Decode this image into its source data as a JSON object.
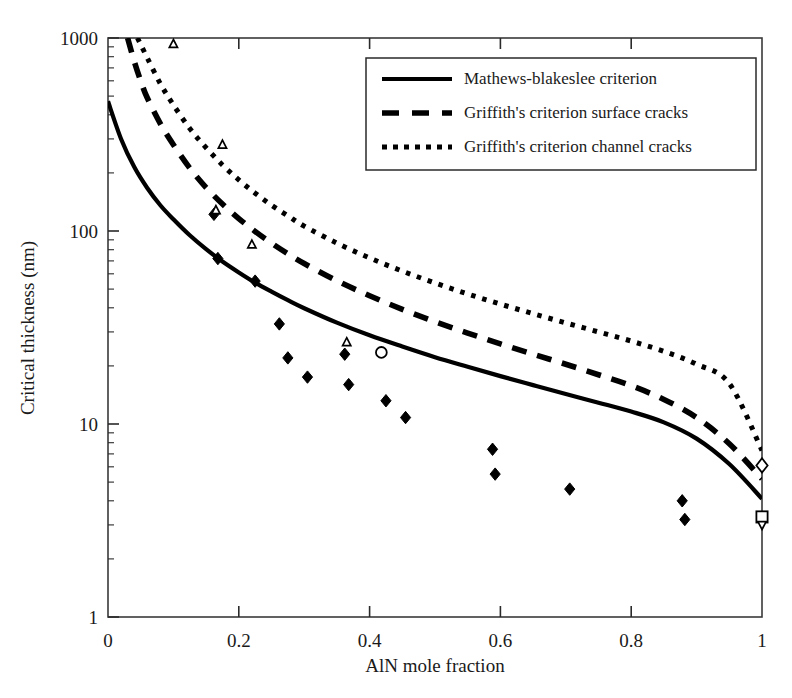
{
  "chart_data": {
    "type": "line",
    "title": "",
    "xlabel": "AlN mole fraction",
    "ylabel": "Critical thickness (nm)",
    "xlim": [
      0,
      1
    ],
    "ylim": [
      1,
      1000
    ],
    "yscale": "log",
    "xscale": "linear",
    "grid": false,
    "xticks": [
      "0",
      "0.2",
      "0.4",
      "0.6",
      "0.8",
      "1"
    ],
    "xtick_values": [
      0,
      0.2,
      0.4,
      0.6,
      0.8,
      1
    ],
    "yticks": [
      "1",
      "10",
      "100",
      "1000"
    ],
    "ytick_values": [
      1,
      10,
      100,
      1000
    ],
    "legend_position": "top-right",
    "series": [
      {
        "name": "Mathews-blakeslee criterion",
        "style": "solid",
        "color": "#000000",
        "x": [
          0.0,
          0.02,
          0.04,
          0.06,
          0.08,
          0.1,
          0.125,
          0.15,
          0.175,
          0.2,
          0.225,
          0.25,
          0.275,
          0.3,
          0.35,
          0.4,
          0.45,
          0.5,
          0.55,
          0.6,
          0.65,
          0.7,
          0.75,
          0.8,
          0.85,
          0.9,
          0.95,
          1.0
        ],
        "y": [
          470,
          300,
          215,
          167,
          136,
          115,
          95,
          80.5,
          69.5,
          61,
          54,
          48.5,
          43.8,
          39.8,
          33.5,
          28.8,
          25.2,
          22.2,
          19.8,
          17.7,
          15.9,
          14.3,
          12.9,
          11.6,
          10.2,
          8.4,
          6.2,
          4.1
        ]
      },
      {
        "name": "Griffith's criterion surface cracks",
        "style": "dashed",
        "color": "#000000",
        "x": [
          0.03,
          0.04,
          0.05,
          0.06,
          0.08,
          0.1,
          0.125,
          0.15,
          0.175,
          0.2,
          0.225,
          0.25,
          0.275,
          0.3,
          0.35,
          0.4,
          0.45,
          0.5,
          0.55,
          0.6,
          0.65,
          0.7,
          0.75,
          0.8,
          0.85,
          0.9,
          0.95,
          1.0
        ],
        "y": [
          1000,
          760,
          600,
          490,
          360,
          280,
          212,
          168,
          138,
          116,
          99.5,
          86.5,
          76.2,
          67.8,
          55.2,
          46.2,
          39.3,
          33.9,
          29.6,
          26.0,
          23.0,
          20.4,
          18.0,
          15.8,
          13.4,
          10.8,
          7.9,
          5.2
        ]
      },
      {
        "name": "Griffith's criterion channel cracks",
        "style": "dotted",
        "color": "#000000",
        "x": [
          0.045,
          0.06,
          0.08,
          0.1,
          0.125,
          0.15,
          0.175,
          0.2,
          0.225,
          0.25,
          0.275,
          0.3,
          0.35,
          0.4,
          0.45,
          0.5,
          0.55,
          0.6,
          0.65,
          0.7,
          0.75,
          0.8,
          0.85,
          0.9,
          0.95,
          1.0
        ],
        "y": [
          1000,
          790,
          580,
          450,
          340,
          270,
          220,
          184,
          157,
          136,
          120,
          106,
          86.5,
          72.5,
          62.0,
          53.8,
          47.2,
          41.8,
          37.3,
          33.4,
          30.0,
          26.9,
          23.8,
          20.4,
          16.2,
          7.3
        ]
      }
    ],
    "scatter": [
      {
        "name": "filled-diamond-data",
        "marker": "filled-diamond",
        "points": [
          {
            "x": 0.162,
            "y": 122
          },
          {
            "x": 0.168,
            "y": 72
          },
          {
            "x": 0.225,
            "y": 55
          },
          {
            "x": 0.262,
            "y": 33
          },
          {
            "x": 0.275,
            "y": 22
          },
          {
            "x": 0.305,
            "y": 17.5
          },
          {
            "x": 0.362,
            "y": 23
          },
          {
            "x": 0.368,
            "y": 16
          },
          {
            "x": 0.425,
            "y": 13.2
          },
          {
            "x": 0.455,
            "y": 10.8
          },
          {
            "x": 0.588,
            "y": 7.4
          },
          {
            "x": 0.592,
            "y": 5.5
          },
          {
            "x": 0.706,
            "y": 4.6
          },
          {
            "x": 0.878,
            "y": 4.0
          },
          {
            "x": 0.882,
            "y": 3.2
          }
        ]
      },
      {
        "name": "open-triangle-data",
        "marker": "open-triangle-up",
        "points": [
          {
            "x": 0.1,
            "y": 930
          },
          {
            "x": 0.175,
            "y": 280
          },
          {
            "x": 0.165,
            "y": 128
          },
          {
            "x": 0.22,
            "y": 85
          },
          {
            "x": 0.365,
            "y": 26.5
          }
        ]
      },
      {
        "name": "open-circle-data",
        "marker": "open-circle",
        "points": [
          {
            "x": 0.418,
            "y": 23.5
          }
        ]
      },
      {
        "name": "open-diamond-data",
        "marker": "open-diamond",
        "points": [
          {
            "x": 1.0,
            "y": 6.1
          }
        ]
      },
      {
        "name": "open-square-data",
        "marker": "open-square",
        "points": [
          {
            "x": 1.0,
            "y": 3.3
          }
        ]
      },
      {
        "name": "open-triangle-down-data",
        "marker": "open-triangle-down",
        "points": [
          {
            "x": 1.0,
            "y": 3.0
          }
        ]
      }
    ]
  },
  "legend": {
    "items": [
      {
        "label": "Mathews-blakeslee criterion",
        "style": "solid"
      },
      {
        "label": "Griffith's criterion surface cracks",
        "style": "dashed"
      },
      {
        "label": "Griffith's criterion channel cracks",
        "style": "dotted"
      }
    ]
  }
}
